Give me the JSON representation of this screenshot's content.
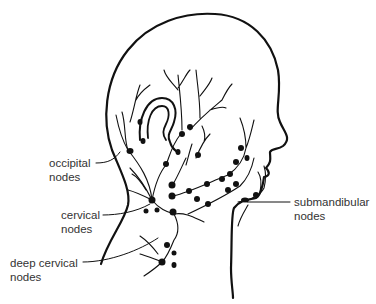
{
  "diagram": {
    "colors": {
      "line": "#111111",
      "text": "#333333",
      "background": "#ffffff"
    },
    "labels": [
      {
        "id": "occipital",
        "line1": "occipital",
        "line2": "nodes",
        "x": 49,
        "y": 156
      },
      {
        "id": "cervical",
        "line1": "cervical",
        "line2": "nodes",
        "x": 61,
        "y": 208
      },
      {
        "id": "deep-cervical",
        "line1": "deep cervical",
        "line2": "nodes",
        "x": 10,
        "y": 258
      },
      {
        "id": "submandibular",
        "line1": "submandibular",
        "line2": "nodes",
        "x": 294,
        "y": 198
      }
    ]
  }
}
